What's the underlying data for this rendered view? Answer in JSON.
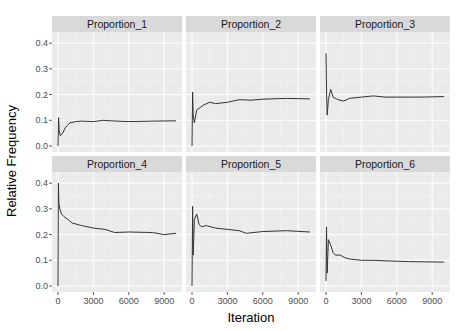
{
  "chart_data": {
    "type": "line",
    "layout": "facet_wrap",
    "facet_rows": 2,
    "facet_cols": 3,
    "xlabel": "Iteration",
    "ylabel": "Relative Frequency",
    "xlim": [
      0,
      10000
    ],
    "ylim": [
      0,
      0.42
    ],
    "x_ticks": [
      0,
      3000,
      6000,
      9000
    ],
    "x_tick_labels": [
      "0",
      "3000",
      "6000",
      "9000"
    ],
    "y_ticks": [
      0.0,
      0.1,
      0.2,
      0.3,
      0.4
    ],
    "y_tick_labels": [
      "0.0",
      "0.1",
      "0.2",
      "0.3",
      "0.4"
    ],
    "grid": true,
    "legend": "none",
    "colors": {
      "panel_bg": "#ebebeb",
      "strip_bg": "#d9d9d9",
      "grid_major": "#ffffff",
      "line": "#333333"
    },
    "panels": [
      {
        "name": "Proportion_1",
        "x": [
          0,
          50,
          100,
          200,
          400,
          600,
          800,
          1000,
          1500,
          2000,
          3000,
          3800,
          4500,
          6000,
          8000,
          10000
        ],
        "y": [
          0.0,
          0.11,
          0.06,
          0.04,
          0.05,
          0.07,
          0.08,
          0.09,
          0.095,
          0.097,
          0.095,
          0.1,
          0.098,
          0.095,
          0.097,
          0.098
        ]
      },
      {
        "name": "Proportion_2",
        "x": [
          0,
          50,
          100,
          200,
          400,
          700,
          1000,
          1500,
          2000,
          3000,
          4000,
          5000,
          6000,
          8000,
          10000
        ],
        "y": [
          0.0,
          0.21,
          0.12,
          0.09,
          0.14,
          0.15,
          0.16,
          0.17,
          0.165,
          0.17,
          0.18,
          0.178,
          0.182,
          0.185,
          0.183
        ]
      },
      {
        "name": "Proportion_3",
        "x": [
          0,
          50,
          100,
          200,
          400,
          600,
          1000,
          1500,
          2000,
          3000,
          4000,
          5000,
          6000,
          8000,
          10000
        ],
        "y": [
          0.36,
          0.2,
          0.12,
          0.18,
          0.22,
          0.19,
          0.18,
          0.175,
          0.185,
          0.19,
          0.195,
          0.19,
          0.19,
          0.19,
          0.192
        ]
      },
      {
        "name": "Proportion_4",
        "x": [
          0,
          30,
          80,
          150,
          300,
          500,
          800,
          1200,
          2000,
          3000,
          4000,
          4800,
          6000,
          8000,
          9000,
          10000
        ],
        "y": [
          0.0,
          0.4,
          0.32,
          0.3,
          0.28,
          0.27,
          0.26,
          0.245,
          0.235,
          0.225,
          0.22,
          0.208,
          0.21,
          0.208,
          0.2,
          0.205
        ]
      },
      {
        "name": "Proportion_5",
        "x": [
          0,
          50,
          100,
          200,
          400,
          600,
          800,
          1200,
          2000,
          3000,
          4000,
          4600,
          6000,
          8000,
          10000
        ],
        "y": [
          0.0,
          0.31,
          0.12,
          0.26,
          0.28,
          0.24,
          0.23,
          0.235,
          0.225,
          0.22,
          0.215,
          0.205,
          0.212,
          0.215,
          0.21
        ]
      },
      {
        "name": "Proportion_6",
        "x": [
          0,
          40,
          100,
          200,
          400,
          600,
          800,
          1200,
          1600,
          2000,
          3000,
          4000,
          5000,
          7000,
          10000
        ],
        "y": [
          0.02,
          0.23,
          0.05,
          0.18,
          0.16,
          0.13,
          0.12,
          0.12,
          0.11,
          0.105,
          0.1,
          0.1,
          0.098,
          0.095,
          0.093
        ]
      }
    ]
  }
}
